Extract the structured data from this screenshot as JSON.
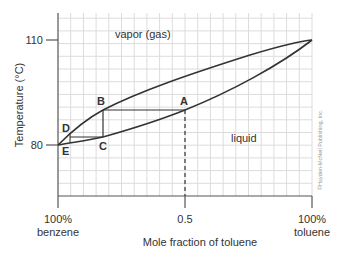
{
  "chart_data": {
    "type": "line",
    "title": "",
    "xlabel": "Mole fraction of toluene",
    "ylabel": "Temperature (°C)",
    "xlim": [
      0,
      1
    ],
    "ylim": [
      70,
      117
    ],
    "x_ticks": [
      {
        "value": 0,
        "label_line1": "100%",
        "label_line2": "benzene"
      },
      {
        "value": 0.5,
        "label_line1": "0.5",
        "label_line2": ""
      },
      {
        "value": 1,
        "label_line1": "100%",
        "label_line2": "toluene"
      }
    ],
    "y_ticks": [
      {
        "value": 110,
        "label": "110"
      },
      {
        "value": 80,
        "label": "80"
      }
    ],
    "grid": true,
    "series": [
      {
        "name": "vapor curve (dew point)",
        "x": [
          0,
          0.05,
          0.18,
          0.35,
          0.5,
          0.75,
          1.0
        ],
        "y": [
          80,
          84,
          90,
          96,
          99.4,
          105.7,
          110
        ]
      },
      {
        "name": "liquid curve (boiling point)",
        "x": [
          0,
          0.18,
          0.35,
          0.5,
          0.75,
          1.0
        ],
        "y": [
          80,
          82.3,
          86,
          90,
          98.6,
          110
        ]
      }
    ],
    "points": [
      {
        "label": "A",
        "x": 0.5,
        "y": 90
      },
      {
        "label": "B",
        "x": 0.18,
        "y": 90
      },
      {
        "label": "C",
        "x": 0.18,
        "y": 82.3
      },
      {
        "label": "D",
        "x": 0.05,
        "y": 84
      },
      {
        "label": "E",
        "x": 0.02,
        "y": 80
      }
    ],
    "region_labels": [
      "vapor (gas)",
      "liquid"
    ],
    "annotations": [
      "dashed vertical line at x = 0.5 from A down to axis"
    ]
  },
  "text": {
    "ylabel": "Temperature (°C)",
    "xlabel": "Mole fraction of toluene",
    "y110": "110",
    "y80": "80",
    "x0a": "100%",
    "x0b": "benzene",
    "x05": "0.5",
    "x1a": "100%",
    "x1b": "toluene",
    "vapor": "vapor (gas)",
    "liquid": "liquid",
    "A": "A",
    "B": "B",
    "C": "C",
    "D": "D",
    "E": "E",
    "copyright": "©Hayden-McNeil Publishing, Inc."
  },
  "colors": {
    "grid": "#d9d9d9",
    "axis": "#555555",
    "curve": "#333333",
    "text": "#333333"
  }
}
